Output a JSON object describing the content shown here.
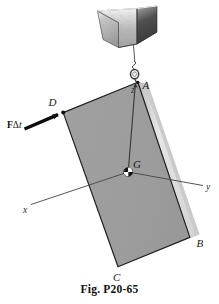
{
  "figure": {
    "caption": "Fig. P20-65",
    "type": "engineering-mechanics-diagram",
    "labels": {
      "point_a": "A",
      "point_b": "B",
      "point_c": "C",
      "point_d": "D",
      "center_of_gravity": "G",
      "axis_x": "x",
      "axis_y": "y",
      "axis_z": "z"
    },
    "force": {
      "symbol_bold": "F",
      "symbol_delta": "Δ",
      "symbol_time": "t",
      "full_label": "FΔt"
    },
    "parts": {
      "bucket_label": "concrete-bucket",
      "cable_label": "suspension-cable",
      "ring_label": "eye-ring",
      "plate_label": "rectangular-plate"
    },
    "colors": {
      "plate_face": "#9b9b9b",
      "plate_edge_light": "#e2e2e2",
      "plate_edge_mid": "#c5c5c5",
      "outline": "#1c1c1c",
      "bucket_light": "#cfcfcf",
      "bucket_dark": "#4a4a4a",
      "axis_line": "#3c3c3c",
      "background": "#ffffff"
    }
  }
}
